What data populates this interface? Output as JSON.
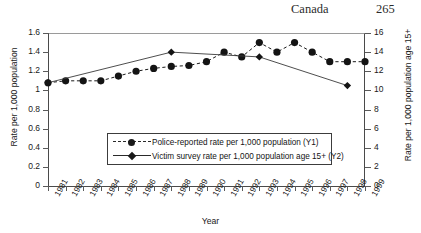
{
  "page": {
    "running_head": "Canada",
    "page_number": "265"
  },
  "chart_data": {
    "type": "line",
    "title": "",
    "xlabel": "Year",
    "ylabel": "Rate per 1,000 population",
    "ylabel_secondary": "Rate per 1,000 population age 15+",
    "grid": false,
    "legend_position": "inside-lower-center",
    "categories": [
      "1981",
      "1982",
      "1983",
      "1984",
      "1985",
      "1986",
      "1987",
      "1988",
      "1989",
      "1990",
      "1991",
      "1992",
      "1993",
      "1994",
      "1995",
      "1996",
      "1997",
      "1998",
      "1999"
    ],
    "x": [
      1981,
      1982,
      1983,
      1984,
      1985,
      1986,
      1987,
      1988,
      1989,
      1990,
      1991,
      1992,
      1993,
      1994,
      1995,
      1996,
      1997,
      1998,
      1999
    ],
    "ylim": [
      0,
      1.6
    ],
    "yticks": [
      "0",
      "0.2",
      "0.4",
      "0.6",
      "0.8",
      "1",
      "1.2",
      "1.4",
      "1.6"
    ],
    "ylim_secondary": [
      0,
      16
    ],
    "yticks_secondary": [
      "0",
      "2",
      "4",
      "6",
      "8",
      "10",
      "12",
      "14",
      "16"
    ],
    "series": [
      {
        "name": "Police-reported rate per 1,000 population (Y1)",
        "axis": "Y1",
        "marker": "circle",
        "linestyle": "dashed",
        "color": "#1a1a1a",
        "x": [
          1981,
          1982,
          1983,
          1984,
          1985,
          1986,
          1987,
          1988,
          1989,
          1990,
          1991,
          1992,
          1993,
          1994,
          1995,
          1996,
          1997,
          1998,
          1999
        ],
        "values": [
          1.08,
          1.1,
          1.1,
          1.1,
          1.15,
          1.2,
          1.23,
          1.25,
          1.26,
          1.3,
          1.4,
          1.35,
          1.5,
          1.4,
          1.5,
          1.4,
          1.3,
          1.3,
          1.3
        ]
      },
      {
        "name": "Victim survey rate per 1,000 population age 15+ (Y2)",
        "axis": "Y2",
        "marker": "diamond",
        "linestyle": "solid",
        "color": "#3a3a3a",
        "x": [
          1981,
          1988,
          1993,
          1998
        ],
        "values": [
          10.8,
          14.0,
          13.5,
          10.5
        ]
      }
    ]
  }
}
